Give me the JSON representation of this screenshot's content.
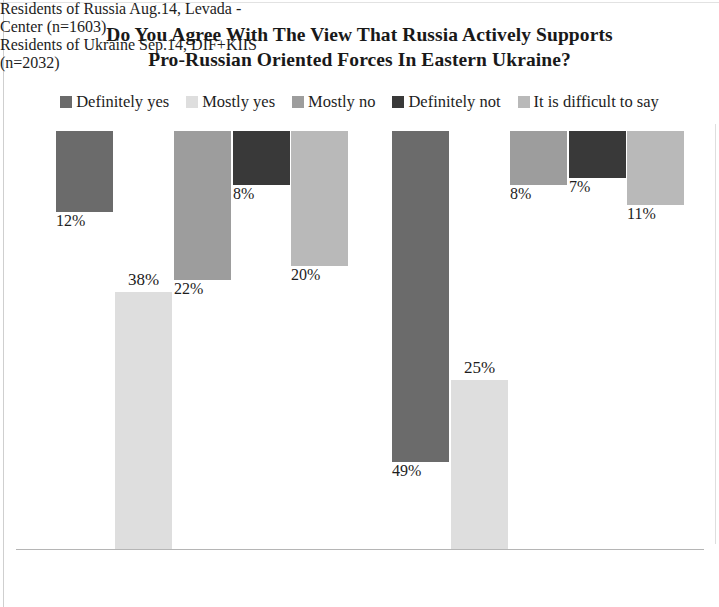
{
  "chart_data": {
    "type": "bar",
    "title": "Do You Agree With The View That Russia Actively Supports Pro-Russian Oriented Forces In Eastern Ukraine?",
    "title_lines": [
      "Do You Agree With The View That Russia Actively Supports",
      "Pro-Russian Oriented Forces In Eastern Ukraine?"
    ],
    "xlabel": "",
    "ylabel": "",
    "ylim": [
      0,
      55
    ],
    "grid": false,
    "legend_position": "top",
    "value_suffix": "%",
    "categories": [
      "Residents of Russia Aug.14, Levada - Center (n=1603)",
      "Residents of Ukraine Sep.14, DIF+KIIS (n=2032)"
    ],
    "category_lines": [
      [
        "Residents of Russia Aug.14, Levada -",
        "Center (n=1603)"
      ],
      [
        "Residents of Ukraine Sep.14, DIF+KIIS",
        "(n=2032)"
      ]
    ],
    "series": [
      {
        "name": "Definitely yes",
        "color": "#6b6b6b",
        "values": [
          12,
          49
        ],
        "labels": [
          "12%",
          "49%"
        ]
      },
      {
        "name": "Mostly yes",
        "color": "#dedede",
        "values": [
          38,
          25
        ],
        "labels": [
          "38%",
          "25%"
        ]
      },
      {
        "name": "Mostly no",
        "color": "#9d9d9d",
        "values": [
          22,
          8
        ],
        "labels": [
          "22%",
          "8%"
        ]
      },
      {
        "name": "Definitely not",
        "color": "#393939",
        "values": [
          8,
          7
        ],
        "labels": [
          "8%",
          "7%"
        ]
      },
      {
        "name": "It is difficult to say",
        "color": "#b9b9b9",
        "values": [
          20,
          11
        ],
        "labels": [
          "20%",
          "11%"
        ]
      }
    ]
  },
  "legend": {
    "items": [
      {
        "label": "Definitely yes",
        "color": "#6b6b6b"
      },
      {
        "label": "Mostly yes",
        "color": "#dedede"
      },
      {
        "label": "Mostly no",
        "color": "#9d9d9d"
      },
      {
        "label": "Definitely not",
        "color": "#393939"
      },
      {
        "label": "It is difficult to say",
        "color": "#b9b9b9"
      }
    ]
  }
}
